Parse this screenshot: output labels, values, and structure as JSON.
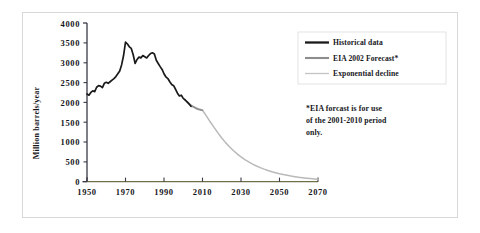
{
  "chart_data": {
    "type": "line",
    "title": "",
    "xlabel": "",
    "ylabel": "Million barrels/year",
    "xlim": [
      1950,
      2070
    ],
    "ylim": [
      0,
      4000
    ],
    "xticks": [
      "1950",
      "1970",
      "1990",
      "2010",
      "2030",
      "2050",
      "2070"
    ],
    "yticks": [
      "0",
      "500",
      "1000",
      "1500",
      "2000",
      "2500",
      "3000",
      "3500",
      "4000"
    ],
    "grid": false,
    "legend_position": "right-top",
    "series": [
      {
        "name": "Historical data",
        "color": "#1a1a1a",
        "x": [
          1950,
          1951,
          1952,
          1953,
          1954,
          1955,
          1956,
          1957,
          1958,
          1959,
          1960,
          1961,
          1962,
          1963,
          1964,
          1965,
          1966,
          1967,
          1968,
          1969,
          1970,
          1971,
          1972,
          1973,
          1974,
          1975,
          1976,
          1977,
          1978,
          1979,
          1980,
          1981,
          1982,
          1983,
          1984,
          1985,
          1986,
          1987,
          1988,
          1989,
          1990,
          1991,
          1992,
          1993,
          1994,
          1995,
          1996,
          1997,
          1998,
          1999,
          2000,
          2001,
          2002,
          2003,
          2004
        ],
        "values": [
          2210,
          2180,
          2250,
          2290,
          2270,
          2380,
          2420,
          2410,
          2370,
          2480,
          2505,
          2480,
          2520,
          2560,
          2600,
          2650,
          2720,
          2790,
          2950,
          3180,
          3520,
          3470,
          3400,
          3360,
          3200,
          2980,
          3080,
          3140,
          3120,
          3180,
          3150,
          3120,
          3180,
          3230,
          3250,
          3220,
          3060,
          2980,
          2900,
          2830,
          2720,
          2640,
          2600,
          2520,
          2450,
          2420,
          2330,
          2230,
          2160,
          2180,
          2100,
          2060,
          2010,
          1960,
          1900
        ]
      },
      {
        "name": "EIA 2002 Forecast*",
        "color": "#8d8d8d",
        "x": [
          2001,
          2002,
          2003,
          2004,
          2005,
          2006,
          2007,
          2008,
          2009,
          2010
        ],
        "values": [
          2060,
          2010,
          1970,
          1930,
          1900,
          1870,
          1840,
          1820,
          1810,
          1800
        ]
      },
      {
        "name": "Exponential decline",
        "color": "#b9b9b9",
        "x": [
          2004,
          2006,
          2008,
          2010,
          2012,
          2014,
          2016,
          2018,
          2020,
          2022,
          2024,
          2026,
          2028,
          2030,
          2032,
          2034,
          2036,
          2038,
          2040,
          2042,
          2044,
          2046,
          2048,
          2050,
          2052,
          2054,
          2056,
          2058,
          2060,
          2062,
          2064,
          2066,
          2068,
          2070
        ],
        "values": [
          1900,
          1870,
          1840,
          1800,
          1660,
          1510,
          1370,
          1230,
          1100,
          985,
          880,
          785,
          700,
          625,
          558,
          498,
          444,
          396,
          354,
          316,
          282,
          252,
          225,
          200,
          179,
          160,
          142,
          127,
          113,
          101,
          90,
          80,
          71,
          64
        ]
      }
    ],
    "annotations": [
      "*EIA forcast is for use",
      "of the 2001-2010 period",
      "only."
    ]
  },
  "legend": {
    "items": [
      {
        "label": "Historical data",
        "swatch": "thick-dark"
      },
      {
        "label": "EIA 2002 Forecast*",
        "swatch": "medium-gray"
      },
      {
        "label": "Exponential decline",
        "swatch": "thin-light"
      }
    ]
  },
  "note": {
    "line1": "*EIA forcast is for use",
    "line2": "of the 2001-2010 period",
    "line3": "only."
  },
  "axes": {
    "ylabel": "Million barrels/year"
  },
  "colors": {
    "historical": "#1a1a1a",
    "forecast": "#8d8d8d",
    "decline": "#b9b9b9",
    "axis": "#3a3a46",
    "baseline": "#6f6f4a",
    "frame": "#d8d8d8"
  }
}
